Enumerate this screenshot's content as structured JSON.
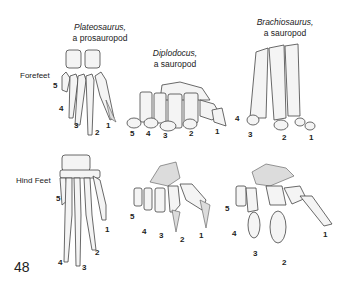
{
  "figure": {
    "page_number": "48",
    "row_labels": {
      "forefeet": "Forefeet",
      "hindfeet": "Hind Feet"
    },
    "columns": [
      {
        "genus": "Plateosaurus,",
        "group": "a prosauropod"
      },
      {
        "genus": "Diplodocus,",
        "group": "a sauropod"
      },
      {
        "genus": "Brachiosaurus,",
        "group": "a sauropod"
      }
    ],
    "digit_labels": {
      "plateosaurus_fore": [
        "5",
        "4",
        "3",
        "2",
        "1"
      ],
      "diplodocus_fore": [
        "5",
        "4",
        "3",
        "2",
        "1"
      ],
      "brachiosaurus_fore": [
        "4",
        "3",
        "2",
        "1"
      ],
      "plateosaurus_hind": [
        "5",
        "4",
        "3",
        "2",
        "1"
      ],
      "diplodocus_hind": [
        "5",
        "4",
        "3",
        "2",
        "1"
      ],
      "brachiosaurus_hind": [
        "5",
        "4",
        "3",
        "2",
        "1"
      ]
    }
  }
}
